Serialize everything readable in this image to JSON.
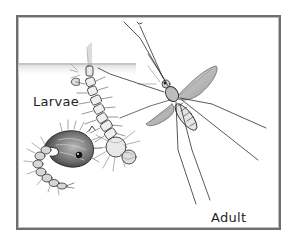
{
  "diagram": {
    "labels": {
      "larvae": "Larvae",
      "adult": "Adult"
    },
    "elements": [
      {
        "name": "water-surface",
        "description": "shaded water surface line across upper-left"
      },
      {
        "name": "larva",
        "description": "segmented larva hanging head-down from water surface by breathing siphon"
      },
      {
        "name": "pupa",
        "description": "comma-shaped pupa with curled segmented tail, lower left"
      },
      {
        "name": "adult-mosquito",
        "description": "adult mosquito with long legs and translucent wings, upper right"
      }
    ],
    "colors": {
      "frame": "#6e6e6e",
      "ink": "#2a2a2a",
      "shade": "#9a9a9a",
      "background": "#ffffff"
    }
  }
}
